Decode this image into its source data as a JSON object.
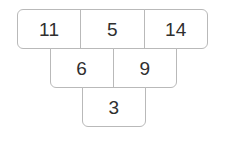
{
  "diagram": {
    "kind": "number-pyramid",
    "orientation": "inverted",
    "background_color": "#ffffff",
    "border_color": "#b9b9b9",
    "cell_fill_color": "#ffffff",
    "text_color": "#2f2f2f",
    "rows": [
      {
        "name": "top-row",
        "cells": [
          {
            "value": "11"
          },
          {
            "value": "5"
          },
          {
            "value": "14"
          }
        ]
      },
      {
        "name": "middle-row",
        "cells": [
          {
            "value": "6"
          },
          {
            "value": "9"
          }
        ]
      },
      {
        "name": "bottom-row",
        "cells": [
          {
            "value": "3"
          }
        ]
      }
    ]
  }
}
